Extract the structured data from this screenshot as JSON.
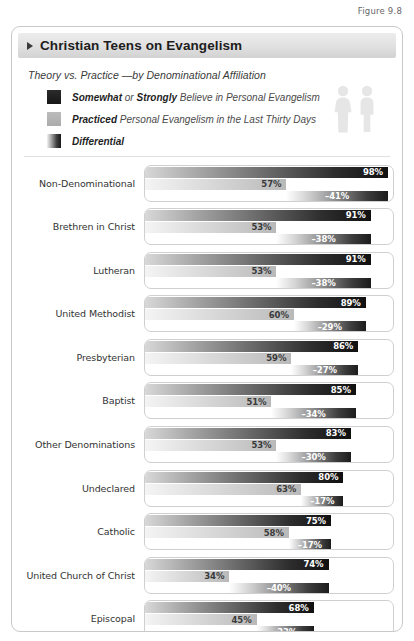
{
  "figure_label": "Figure 9.8",
  "header": {
    "title": "Christian Teens on Evangelism",
    "marker_icon": "triangle-right-icon"
  },
  "subtitle": "Theory vs. Practice —by Denominational Affiliation",
  "legend": {
    "items": [
      {
        "swatch": "dark",
        "icon": "legend-swatch-belief",
        "strong1": "Somewhat",
        "mid": " or ",
        "strong2": "Strongly",
        "rest": " Believe in Personal Evangelism",
        "full": "Somewhat or Strongly Believe in Personal Evangelism"
      },
      {
        "swatch": "gray",
        "icon": "legend-swatch-practiced",
        "strong1": "Practiced",
        "mid": "",
        "strong2": "",
        "rest": " Personal Evangelism in the Last Thirty Days",
        "full": "Practiced Personal Evangelism in the Last Thirty Days"
      },
      {
        "swatch": "diff",
        "icon": "legend-swatch-differential",
        "strong1": "Differential",
        "mid": "",
        "strong2": "",
        "rest": "",
        "full": "Differential"
      }
    ],
    "people_icon": "two-people-icon"
  },
  "chart_data": {
    "type": "bar",
    "title": "Christian Teens on Evangelism",
    "subtitle": "Theory vs. Practice —by Denominational Affiliation",
    "xlabel": "",
    "ylabel": "",
    "xlim": [
      0,
      100
    ],
    "grid": false,
    "legend_position": "top",
    "orientation": "horizontal",
    "categories": [
      "Non-Denominational",
      "Brethren in Christ",
      "Lutheran",
      "United Methodist",
      "Presbyterian",
      "Baptist",
      "Other Denominations",
      "Undeclared",
      "Catholic",
      "United Church of Christ",
      "Episcopal"
    ],
    "series": [
      {
        "name": "Somewhat or Strongly Believe in Personal Evangelism",
        "values": [
          98,
          91,
          91,
          89,
          86,
          85,
          83,
          80,
          75,
          74,
          68
        ],
        "labels": [
          "98%",
          "91%",
          "91%",
          "89%",
          "86%",
          "85%",
          "83%",
          "80%",
          "75%",
          "74%",
          "68%"
        ]
      },
      {
        "name": "Practiced Personal Evangelism in the Last Thirty Days",
        "values": [
          57,
          53,
          53,
          60,
          59,
          51,
          53,
          63,
          58,
          34,
          45
        ],
        "labels": [
          "57%",
          "53%",
          "53%",
          "60%",
          "59%",
          "51%",
          "53%",
          "63%",
          "58%",
          "34%",
          "45%"
        ]
      },
      {
        "name": "Differential",
        "values": [
          -41,
          -38,
          -38,
          -29,
          -27,
          -34,
          -30,
          -17,
          -17,
          -40,
          -23
        ],
        "labels": [
          "–41%",
          "–38%",
          "–38%",
          "–29%",
          "–27%",
          "–34%",
          "–30%",
          "–17%",
          "–17%",
          "–40%",
          "–23%"
        ]
      }
    ]
  }
}
